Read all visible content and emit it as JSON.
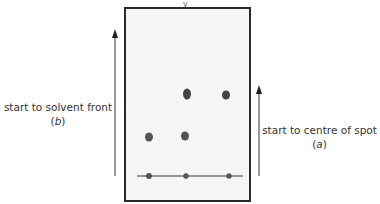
{
  "diagram": {
    "title_fragment": "y",
    "labels": {
      "left_line1": "start to solvent front",
      "left_line2_open": "(",
      "left_line2_var": "b",
      "left_line2_close": ")",
      "right_line1": "start to centre of spot",
      "right_line2_open": "(",
      "right_line2_var": "a",
      "right_line2_close": ")"
    },
    "colors": {
      "frame": "#2a2a2a",
      "plate_bg": "#f6f6f6",
      "spot": "#555555",
      "baseline": "#333333",
      "arrow": "#333333"
    },
    "baseline_spots": [
      {
        "x": 149,
        "y": 176
      },
      {
        "x": 186,
        "y": 176
      },
      {
        "x": 229,
        "y": 176
      }
    ],
    "developed_spots": [
      {
        "x": 149,
        "y": 137,
        "rx": 4,
        "ry": 4.5
      },
      {
        "x": 186,
        "y": 136,
        "rx": 4,
        "ry": 4.5
      },
      {
        "x": 187,
        "y": 94,
        "rx": 4,
        "ry": 5.5
      },
      {
        "x": 226,
        "y": 95,
        "rx": 4,
        "ry": 4.5
      }
    ]
  }
}
